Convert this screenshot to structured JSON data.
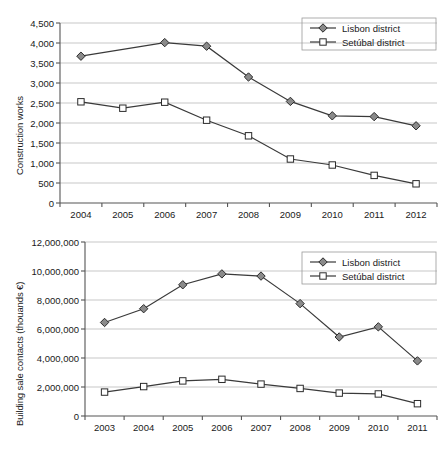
{
  "figure": {
    "background": "#ffffff",
    "line_color": "#3a3a3a",
    "grid_color": "#b9b9b9",
    "axis_color": "#555555",
    "text_color": "#1a1a1a",
    "lisbon_marker_fill": "#8a8a8a",
    "setubal_marker_fill": "#ffffff"
  },
  "chart_data": [
    {
      "type": "line",
      "title": "",
      "xlabel": "",
      "ylabel": "Construction works",
      "categories": [
        "2004",
        "2005",
        "2006",
        "2007",
        "2008",
        "2009",
        "2010",
        "2011",
        "2012"
      ],
      "ylim": [
        0,
        4500
      ],
      "yticks": [
        "0",
        "500",
        "1,000",
        "1,500",
        "2,000",
        "2,500",
        "3,000",
        "3,500",
        "4,000",
        "4,500"
      ],
      "ytick_values": [
        0,
        500,
        1000,
        1500,
        2000,
        2500,
        3000,
        3500,
        4000,
        4500
      ],
      "grid": true,
      "legend_position": "top-right",
      "series": [
        {
          "name": "Lisbon district",
          "marker": "filled-diamond",
          "values": [
            3670,
            null,
            4010,
            3920,
            3150,
            2540,
            2180,
            2160,
            1930
          ]
        },
        {
          "name": "Setúbal district",
          "marker": "open-square",
          "values": [
            2530,
            2370,
            2520,
            2070,
            1680,
            1100,
            950,
            690,
            480
          ]
        }
      ]
    },
    {
      "type": "line",
      "title": "",
      "xlabel": "",
      "ylabel": "Building sale contacts (thouands €)",
      "categories": [
        "2003",
        "2004",
        "2005",
        "2006",
        "2007",
        "2008",
        "2009",
        "2010",
        "2011"
      ],
      "ylim": [
        0,
        12000000
      ],
      "yticks": [
        "0",
        "2,000,000",
        "4,000,000",
        "6,000,000",
        "8,000,000",
        "10,000,000",
        "12,000,000"
      ],
      "ytick_values": [
        0,
        2000000,
        4000000,
        6000000,
        8000000,
        10000000,
        12000000
      ],
      "grid": true,
      "legend_position": "top-right",
      "series": [
        {
          "name": "Lisbon district",
          "marker": "filled-diamond",
          "values": [
            6450000,
            7400000,
            9050000,
            9800000,
            9650000,
            7750000,
            5450000,
            6150000,
            3800000
          ]
        },
        {
          "name": "Setúbal district",
          "marker": "open-square",
          "values": [
            1650000,
            2030000,
            2420000,
            2530000,
            2200000,
            1900000,
            1580000,
            1520000,
            850000
          ]
        }
      ]
    }
  ]
}
